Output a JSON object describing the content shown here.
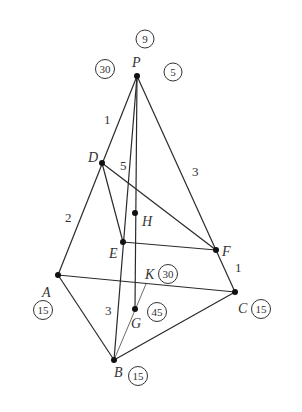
{
  "diagram": {
    "type": "geometry-tetrahedron-network",
    "points": {
      "P": {
        "label": "P",
        "x": 137,
        "y": 76
      },
      "D": {
        "label": "D",
        "x": 102,
        "y": 163
      },
      "H": {
        "label": "H",
        "x": 135,
        "y": 213
      },
      "E": {
        "label": "E",
        "x": 123,
        "y": 242
      },
      "F": {
        "label": "F",
        "x": 216,
        "y": 250
      },
      "A": {
        "label": "A",
        "x": 58,
        "y": 275
      },
      "K": {
        "label": "K",
        "x": 146,
        "y": 284
      },
      "C": {
        "label": "C",
        "x": 235,
        "y": 292
      },
      "G": {
        "label": "G",
        "x": 135,
        "y": 309
      },
      "B": {
        "label": "B",
        "x": 114,
        "y": 360
      }
    },
    "edge_labels": {
      "PD": "1",
      "DA": "2",
      "DE": "5",
      "PF": "3",
      "FC": "1",
      "EB": "3"
    },
    "circled_values": {
      "P_top": "9",
      "P_left": "30",
      "P_right": "5",
      "A": "15",
      "B": "15",
      "C": "15",
      "K": "30",
      "G": "45"
    }
  }
}
